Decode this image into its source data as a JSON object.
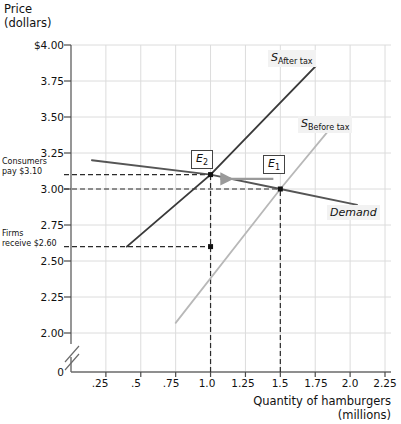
{
  "chart_data": {
    "type": "line",
    "title": "",
    "ylabel": "Price (dollars)",
    "xlabel": "Quantity of hamburgers (millions)",
    "xlim": [
      0,
      2.25
    ],
    "ylim": [
      2.0,
      4.0
    ],
    "grid": true,
    "legend_position": "inline",
    "y_axis_break": true,
    "y_ticks": [
      "$4.00",
      "3.75",
      "3.50",
      "3.25",
      "3.00",
      "2.75",
      "2.50",
      "2.25",
      "2.00",
      "0"
    ],
    "y_tick_values": [
      4.0,
      3.75,
      3.5,
      3.25,
      3.0,
      2.75,
      2.5,
      2.25,
      2.0,
      0
    ],
    "x_ticks": [
      ".25",
      ".5",
      ".75",
      "1.0",
      "1.25",
      "1.5",
      "1.75",
      "2.0",
      "2.25"
    ],
    "x_tick_values": [
      0.25,
      0.5,
      0.75,
      1.0,
      1.25,
      1.5,
      1.75,
      2.0,
      2.25
    ],
    "series": [
      {
        "name": "S_After tax",
        "label": "S",
        "sublabel": "After tax",
        "color": "#3a3a3a",
        "points": [
          [
            0.4,
            2.6
          ],
          [
            1.0,
            3.1
          ],
          [
            1.75,
            3.85
          ]
        ]
      },
      {
        "name": "S_Before tax",
        "label": "S",
        "sublabel": "Before tax",
        "color": "#b8b8b8",
        "points": [
          [
            0.75,
            2.07
          ],
          [
            1.5,
            3.0
          ],
          [
            1.9,
            3.47
          ]
        ]
      },
      {
        "name": "Demand",
        "label": "Demand",
        "color": "#555555",
        "points": [
          [
            0.15,
            3.2
          ],
          [
            1.0,
            3.1
          ],
          [
            1.5,
            3.0
          ],
          [
            2.05,
            2.89
          ]
        ]
      }
    ],
    "equilibria": [
      {
        "id": "E2",
        "label": "E",
        "sub": "2",
        "x": 1.0,
        "y": 3.1
      },
      {
        "id": "E1",
        "label": "E",
        "sub": "1",
        "x": 1.5,
        "y": 3.0
      }
    ],
    "markers": [
      {
        "x": 1.0,
        "y": 3.1
      },
      {
        "x": 1.5,
        "y": 3.0
      },
      {
        "x": 1.0,
        "y": 2.6
      }
    ],
    "annotations": [
      {
        "id": "consumers-pay",
        "text_line1": "Consumers",
        "text_line2": "pay $3.10",
        "value": 3.1
      },
      {
        "id": "firms-receive",
        "text_line1": "Firms",
        "text_line2": "receive $2.60",
        "value": 2.6
      }
    ],
    "guide_lines": [
      {
        "type": "horizontal",
        "value": 3.1,
        "style": "dashed"
      },
      {
        "type": "horizontal",
        "value": 3.0,
        "style": "dashed"
      },
      {
        "type": "horizontal",
        "value": 2.6,
        "style": "dashed"
      },
      {
        "type": "vertical",
        "value": 1.0,
        "style": "dashed"
      },
      {
        "type": "vertical",
        "value": 1.5,
        "style": "dashed"
      }
    ],
    "shift_arrow": {
      "from_x": 1.45,
      "to_x": 1.07,
      "y": 3.07,
      "direction": "left"
    }
  }
}
